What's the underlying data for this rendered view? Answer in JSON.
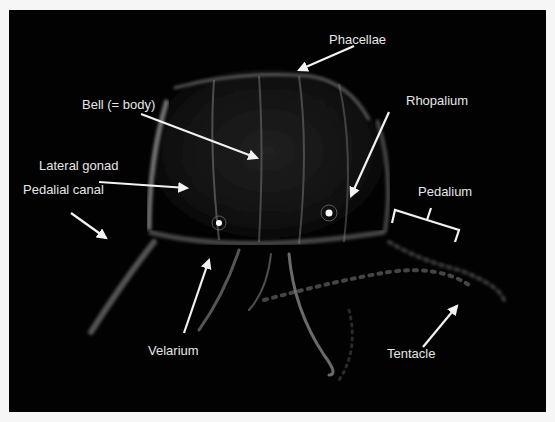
{
  "figure": {
    "background_color": "#020202",
    "label_color": "#e6e6e6",
    "labels": [
      {
        "id": "phacellae",
        "text": "Phacellae",
        "x": 320,
        "y": 22
      },
      {
        "id": "bell",
        "text": "Bell (= body)",
        "x": 73,
        "y": 87
      },
      {
        "id": "rhopalium",
        "text": "Rhopalium",
        "x": 397,
        "y": 83
      },
      {
        "id": "lateral-gonad",
        "text": "Lateral gonad",
        "x": 30,
        "y": 148
      },
      {
        "id": "pedalium",
        "text": "Pedalium",
        "x": 409,
        "y": 123
      },
      {
        "id": "pedalial-canal",
        "text": "Pedalial canal",
        "x": 14,
        "y": 172
      },
      {
        "id": "velarium",
        "text": "Velarium",
        "x": 139,
        "y": 333
      },
      {
        "id": "tentacle",
        "text": "Tentacle",
        "x": 378,
        "y": 336
      }
    ]
  }
}
